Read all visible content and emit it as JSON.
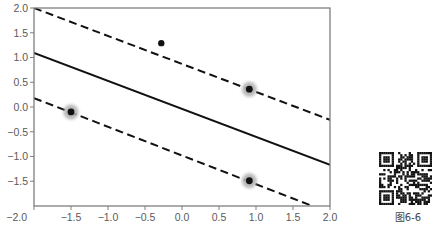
{
  "chart_data": {
    "type": "scatter",
    "title": "",
    "xlabel": "",
    "ylabel": "",
    "xlim": [
      -2.0,
      2.0
    ],
    "ylim": [
      -2.0,
      2.0
    ],
    "grid": false,
    "legend": null,
    "xticks": [
      {
        "value": -2.0,
        "label": "−2.0"
      },
      {
        "value": -1.5,
        "label": "−1.5"
      },
      {
        "value": -1.0,
        "label": "−1.0"
      },
      {
        "value": -0.5,
        "label": "−0.5"
      },
      {
        "value": 0.0,
        "label": "0.0"
      },
      {
        "value": 0.5,
        "label": "0.5"
      },
      {
        "value": 1.0,
        "label": "1.0"
      },
      {
        "value": 1.5,
        "label": "1.5"
      },
      {
        "value": 2.0,
        "label": "2.0"
      }
    ],
    "yticks": [
      {
        "value": -1.5,
        "label": "−1.5"
      },
      {
        "value": -1.0,
        "label": "−1.0"
      },
      {
        "value": -0.5,
        "label": "−0.5"
      },
      {
        "value": 0.0,
        "label": "0.0"
      },
      {
        "value": 0.5,
        "label": "0.5"
      },
      {
        "value": 1.0,
        "label": "1.0"
      },
      {
        "value": 1.5,
        "label": "1.5"
      },
      {
        "value": 2.0,
        "label": "2.0"
      }
    ],
    "lines": [
      {
        "name": "decision-boundary",
        "style": "solid",
        "points": [
          [
            -2.0,
            1.09
          ],
          [
            2.0,
            -1.17
          ]
        ]
      },
      {
        "name": "upper-margin",
        "style": "dashed",
        "points": [
          [
            -2.0,
            2.0
          ],
          [
            2.0,
            -0.26
          ]
        ]
      },
      {
        "name": "lower-margin",
        "style": "dashed",
        "points": [
          [
            -2.0,
            0.18
          ],
          [
            1.76,
            -2.0
          ]
        ]
      }
    ],
    "points": [
      {
        "x": -0.28,
        "y": 1.29,
        "support_vector": false
      },
      {
        "x": -1.5,
        "y": -0.1,
        "support_vector": true
      },
      {
        "x": 0.91,
        "y": 0.36,
        "support_vector": true
      },
      {
        "x": 0.91,
        "y": -1.49,
        "support_vector": true
      }
    ],
    "colors": {
      "axis": "#7f7f7f",
      "line": "#111111",
      "point": "#111111",
      "halo": "#b0b0b0"
    }
  },
  "figure": {
    "caption": "图6-6",
    "qr_code": "qr-code"
  }
}
